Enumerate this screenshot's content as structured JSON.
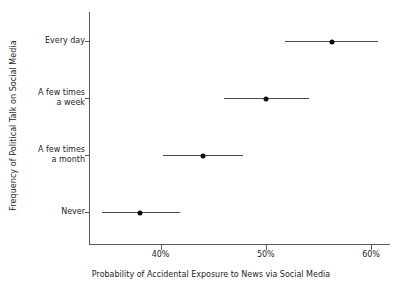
{
  "chart_data": {
    "type": "scatter",
    "title": "",
    "xlabel": "Probability of Accidental Exposure to News via Social Media",
    "ylabel": "Frequency of Political Talk on Social Media",
    "orientation": "horizontal",
    "grid": false,
    "legend": null,
    "xlim": [
      33.2,
      61.8
    ],
    "xticks": [
      40,
      50,
      60
    ],
    "xtick_labels": [
      "40%",
      "50%",
      "60%"
    ],
    "categories": [
      "Every day",
      "A few times a week",
      "A few times a month",
      "Never"
    ],
    "category_lines": [
      [
        "Every day"
      ],
      [
        "A few times",
        "a week"
      ],
      [
        "A few times",
        "a month"
      ],
      [
        "Never"
      ]
    ],
    "values": [
      56.3,
      50.0,
      44.0,
      38.0
    ],
    "ci_low": [
      51.8,
      46.0,
      40.2,
      34.4
    ],
    "ci_high": [
      60.7,
      54.1,
      47.8,
      41.8
    ],
    "points": [
      {
        "category": "Every day",
        "estimate": 56.3,
        "ci_low": 51.8,
        "ci_high": 60.7
      },
      {
        "category": "A few times a week",
        "estimate": 50.0,
        "ci_low": 46.0,
        "ci_high": 54.1
      },
      {
        "category": "A few times a month",
        "estimate": 44.0,
        "ci_low": 40.2,
        "ci_high": 47.8
      },
      {
        "category": "Never",
        "estimate": 38.0,
        "ci_low": 34.4,
        "ci_high": 41.8
      }
    ],
    "colors": {
      "point": "#0d0d0d",
      "errorbar": "#4a4a4a",
      "axis": "#5a5a5a",
      "text": "#231f20",
      "background": "#ffffff"
    }
  }
}
